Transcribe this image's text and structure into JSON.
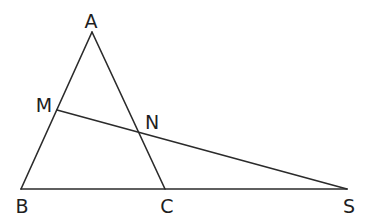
{
  "diagram": {
    "type": "geometry-figure",
    "colors": {
      "background": "#ffffff",
      "stroke": "#2b2b2b",
      "label": "#1e1e1e"
    },
    "points": [
      {
        "id": "A",
        "label": "A",
        "x": 92,
        "y": 32,
        "label_x": 91,
        "label_y": 21
      },
      {
        "id": "M",
        "label": "M",
        "x": 57,
        "y": 110,
        "label_x": 44,
        "label_y": 105
      },
      {
        "id": "N",
        "label": "N",
        "x": 139,
        "y": 131,
        "label_x": 152,
        "label_y": 122
      },
      {
        "id": "B",
        "label": "B",
        "x": 21,
        "y": 189,
        "label_x": 22,
        "label_y": 206
      },
      {
        "id": "C",
        "label": "C",
        "x": 165,
        "y": 189,
        "label_x": 167,
        "label_y": 206
      },
      {
        "id": "S",
        "label": "S",
        "x": 347,
        "y": 189,
        "label_x": 349,
        "label_y": 206
      }
    ],
    "segments": [
      {
        "from": "A",
        "to": "B"
      },
      {
        "from": "A",
        "to": "C"
      },
      {
        "from": "B",
        "to": "S"
      },
      {
        "from": "M",
        "to": "S"
      }
    ]
  }
}
